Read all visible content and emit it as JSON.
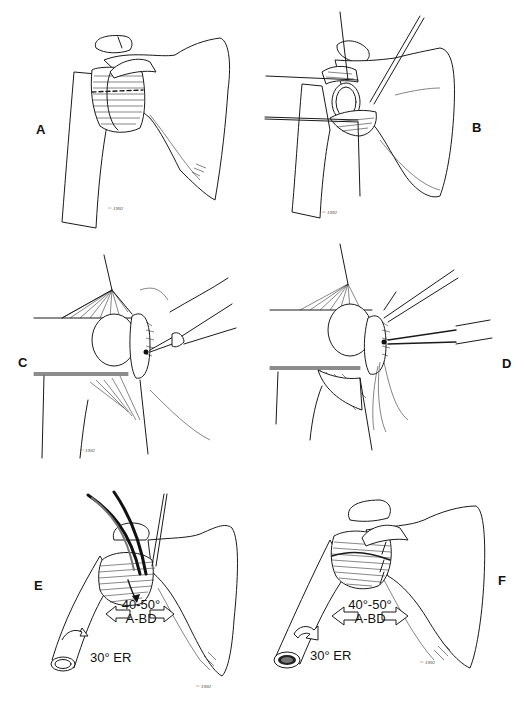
{
  "figure": {
    "panels": [
      {
        "id": "A",
        "label": "A",
        "signature": "© 1992"
      },
      {
        "id": "B",
        "label": "B",
        "signature": "© 1992"
      },
      {
        "id": "C",
        "label": "C",
        "signature": "© 1992"
      },
      {
        "id": "D",
        "label": "D",
        "signature": ""
      },
      {
        "id": "E",
        "label": "E",
        "signature": "© 1992",
        "abduction": "40-50°",
        "abduction_label": "A-BD",
        "rotation": "30° ER"
      },
      {
        "id": "F",
        "label": "F",
        "signature": "© 1992",
        "abduction": "40°-50°",
        "abduction_label": "A-BD",
        "rotation": "30° ER"
      }
    ]
  }
}
